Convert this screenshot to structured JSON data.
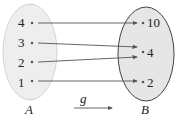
{
  "diagram": {
    "set_a": {
      "label": "A",
      "elements": [
        "4",
        "3",
        "2",
        "1"
      ],
      "fill": "#eeeeee"
    },
    "set_b": {
      "label": "B",
      "elements": [
        "10",
        "4",
        "2"
      ],
      "fill": "#e6e6e6"
    },
    "function_label": "g",
    "mappings": [
      {
        "from": "4",
        "to": "10"
      },
      {
        "from": "3",
        "to": "4"
      },
      {
        "from": "2",
        "to": "4"
      },
      {
        "from": "1",
        "to": "2"
      }
    ]
  }
}
